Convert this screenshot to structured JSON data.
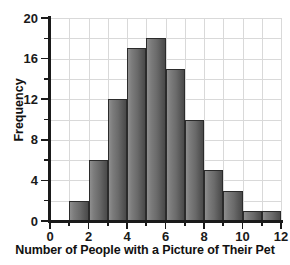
{
  "chart_data": {
    "type": "bar",
    "title": "",
    "xlabel": "Number of People with a Picture of Their Pet",
    "ylabel": "Frequency",
    "categories": [
      "1-2",
      "2-3",
      "3-4",
      "4-5",
      "5-6",
      "6-7",
      "7-8",
      "8-9",
      "9-10",
      "10-11",
      "11-12"
    ],
    "bin_starts": [
      1,
      2,
      3,
      4,
      5,
      6,
      7,
      8,
      9,
      10,
      11
    ],
    "bin_width": 1,
    "values": [
      2,
      6,
      12,
      17,
      18,
      15,
      10,
      5,
      3,
      1,
      1
    ],
    "xlim": [
      0,
      12
    ],
    "ylim": [
      0,
      20
    ],
    "xtick_labels": [
      "0",
      "2",
      "4",
      "6",
      "8",
      "10",
      "12"
    ],
    "xtick_values": [
      0,
      2,
      4,
      6,
      8,
      10,
      12
    ],
    "xtick_minor_values": [
      1,
      3,
      5,
      7,
      9,
      11
    ],
    "ytick_labels": [
      "0",
      "4",
      "8",
      "12",
      "16",
      "20"
    ],
    "ytick_values": [
      0,
      4,
      8,
      12,
      16,
      20
    ],
    "ytick_minor_values": [
      2,
      6,
      10,
      14,
      18
    ],
    "grid": true,
    "grid_x_step": 1,
    "grid_y_step": 2,
    "legend": null,
    "colors": {
      "bar_fill_light": "#8e8e8e",
      "bar_fill_dark": "#4a4a4a",
      "bar_edge": "#2b2b2b",
      "grid": "#d9d9d9",
      "axis": "#1a1a1a",
      "background": "#ffffff",
      "text": "#111111"
    }
  }
}
